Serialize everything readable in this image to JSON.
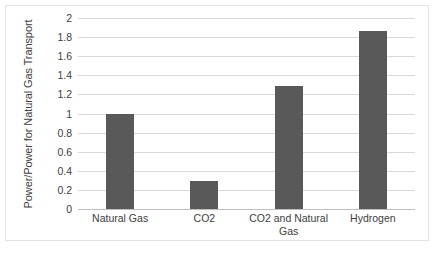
{
  "chart_data": {
    "type": "bar",
    "title": "",
    "xlabel": "",
    "ylabel": "Power/Power for Natural Gas Transport",
    "categories": [
      "Natural Gas",
      "CO2",
      "CO2 and Natural Gas",
      "Hydrogen"
    ],
    "values": [
      1.0,
      0.29,
      1.285,
      1.865
    ],
    "series": [
      {
        "name": "Power/Power for Natural Gas Transport",
        "values": [
          1.0,
          0.29,
          1.285,
          1.865
        ]
      }
    ],
    "ylim": [
      0,
      2
    ],
    "ytick_labels": [
      "0",
      "0.2",
      "0.4",
      "0.6",
      "0.8",
      "1",
      "1.2",
      "1.4",
      "1.6",
      "1.8",
      "2"
    ],
    "ytick_values": [
      0,
      0.2,
      0.4,
      0.6,
      0.8,
      1,
      1.2,
      1.4,
      1.6,
      1.8,
      2
    ],
    "grid": true,
    "grid_axis": "y",
    "legend": false,
    "legend_position": "none",
    "bar_color": "#595959",
    "gridline_color": "#d9d9d9",
    "axis_color": "#bfbfbf",
    "text_color": "#404040",
    "background_color": "#ffffff",
    "frame_color": "#e2e2e2"
  }
}
